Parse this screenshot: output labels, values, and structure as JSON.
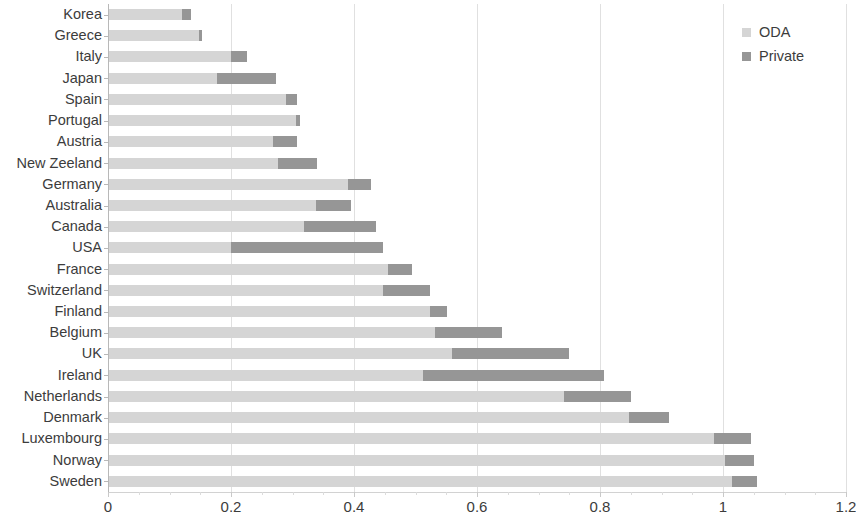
{
  "chart_data": {
    "type": "bar",
    "orientation": "horizontal",
    "stacked": true,
    "title": "",
    "xlabel": "",
    "ylabel": "",
    "xlim": [
      0,
      1.2
    ],
    "xticks": [
      0,
      0.2,
      0.4,
      0.6,
      0.8,
      1,
      1.2
    ],
    "xtick_labels": [
      "0",
      "0.2",
      "0.4",
      "0.6",
      "0.8",
      "1",
      "1.2"
    ],
    "grid": "vertical",
    "legend_position": "top-right",
    "categories": [
      "Korea",
      "Greece",
      "Italy",
      "Japan",
      "Spain",
      "Portugal",
      "Austria",
      "New Zeeland",
      "Germany",
      "Australia",
      "Canada",
      "USA",
      "France",
      "Switzerland",
      "Finland",
      "Belgium",
      "UK",
      "Ireland",
      "Netherlands",
      "Denmark",
      "Luxembourg",
      "Norway",
      "Sweden"
    ],
    "series": [
      {
        "name": "ODA",
        "color": "#d5d5d5",
        "values": [
          0.121,
          0.148,
          0.2,
          0.178,
          0.29,
          0.306,
          0.269,
          0.277,
          0.39,
          0.339,
          0.319,
          0.2,
          0.455,
          0.447,
          0.523,
          0.532,
          0.56,
          0.512,
          0.742,
          0.847,
          0.985,
          1.004,
          1.015
        ]
      },
      {
        "name": "Private",
        "color": "#969696",
        "values": [
          0.014,
          0.005,
          0.026,
          0.095,
          0.018,
          0.006,
          0.038,
          0.063,
          0.037,
          0.056,
          0.116,
          0.247,
          0.04,
          0.076,
          0.029,
          0.108,
          0.19,
          0.294,
          0.108,
          0.065,
          0.06,
          0.046,
          0.04
        ]
      }
    ],
    "totals": [
      0.135,
      0.153,
      0.226,
      0.273,
      0.308,
      0.312,
      0.307,
      0.34,
      0.427,
      0.395,
      0.435,
      0.447,
      0.495,
      0.523,
      0.552,
      0.64,
      0.75,
      0.806,
      0.85,
      0.912,
      1.045,
      1.05,
      1.055
    ]
  },
  "legend": {
    "items": [
      {
        "label": "ODA",
        "color": "#d5d5d5",
        "swatch_name": "legend-swatch-oda"
      },
      {
        "label": "Private",
        "color": "#969696",
        "swatch_name": "legend-swatch-private"
      }
    ]
  }
}
